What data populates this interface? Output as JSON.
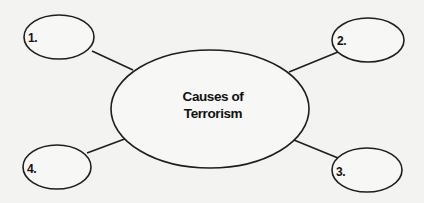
{
  "diagram": {
    "type": "concept-map",
    "colors": {
      "background": "#f3f3f1",
      "stroke": "#1e1e1e",
      "text": "#111111"
    },
    "center": {
      "title_line1": "Causes of",
      "title_line2": "Terrorism"
    },
    "nodes": [
      {
        "label": "1.",
        "position": "top-left",
        "content": ""
      },
      {
        "label": "2.",
        "position": "top-right",
        "content": ""
      },
      {
        "label": "3.",
        "position": "bottom-right",
        "content": ""
      },
      {
        "label": "4.",
        "position": "bottom-left",
        "content": ""
      }
    ]
  }
}
